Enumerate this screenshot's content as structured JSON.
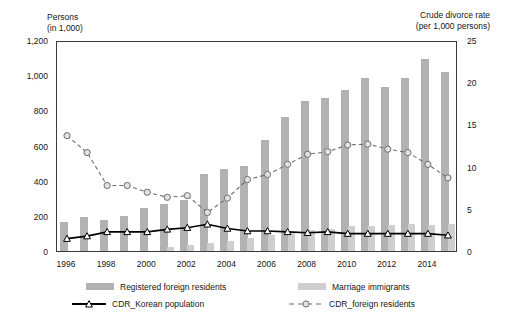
{
  "axes": {
    "left_caption": "Persons\n(in 1,000)",
    "right_caption": "Crude divorce rate\n(per 1,000 persons)",
    "left_ticks": [
      "1,200",
      "1,000",
      "800",
      "600",
      "400",
      "200",
      "0"
    ],
    "right_ticks": [
      "25",
      "20",
      "15",
      "10",
      "5",
      "0"
    ],
    "x_ticks": [
      "1996",
      "1998",
      "2000",
      "2002",
      "2004",
      "2006",
      "2008",
      "2010",
      "2012",
      "2014"
    ]
  },
  "legend": {
    "items": [
      {
        "label": "Registered foreign residents",
        "kind": "bar",
        "color": "#b2b2b2"
      },
      {
        "label": "Marriage immigrants",
        "kind": "bar",
        "color": "#cfcfcf"
      },
      {
        "label": "CDR_Korean population",
        "kind": "line-solid",
        "color": "#000000"
      },
      {
        "label": "CDR_foreign residents",
        "kind": "line-dashed",
        "color": "#6e6e6e"
      }
    ]
  },
  "chart_data": {
    "type": "bar",
    "title": "",
    "xlabel": "",
    "ylabel": "Persons (in 1,000)",
    "y2label": "Crude divorce rate (per 1,000 persons)",
    "ylim": [
      0,
      1200
    ],
    "y2lim": [
      0,
      25
    ],
    "grid": false,
    "legend_position": "bottom",
    "categories": [
      "1996",
      "1997",
      "1998",
      "1999",
      "2000",
      "2001",
      "2002",
      "2003",
      "2004",
      "2005",
      "2006",
      "2007",
      "2008",
      "2009",
      "2010",
      "2011",
      "2012",
      "2013",
      "2014",
      "2015"
    ],
    "series": [
      {
        "name": "Registered foreign residents",
        "axis": "left",
        "type": "bar",
        "color": "#b2b2b2",
        "values": [
          163,
          193,
          177,
          197,
          244,
          267,
          288,
          438,
          469,
          486,
          632,
          765,
          855,
          871,
          918,
          983,
          933,
          985,
          1092,
          1016
        ]
      },
      {
        "name": "Marriage immigrants",
        "axis": "left",
        "type": "bar",
        "color": "#cfcfcf",
        "values": [
          0,
          0,
          0,
          0,
          0,
          23,
          33,
          44,
          57,
          75,
          93,
          110,
          122,
          126,
          142,
          144,
          148,
          151,
          150,
          152
        ]
      },
      {
        "name": "CDR_Korean population",
        "axis": "right",
        "type": "line",
        "color": "#000000",
        "marker": "triangle",
        "values": [
          1.7,
          2.0,
          2.5,
          2.5,
          2.5,
          2.8,
          3.0,
          3.4,
          2.9,
          2.6,
          2.6,
          2.5,
          2.4,
          2.5,
          2.3,
          2.3,
          2.3,
          2.3,
          2.3,
          2.1
        ]
      },
      {
        "name": "CDR_foreign residents",
        "axis": "right",
        "type": "line",
        "color": "#6e6e6e",
        "marker": "circle",
        "dashed": true,
        "values": [
          13.9,
          11.9,
          8.0,
          8.0,
          7.2,
          6.6,
          6.8,
          4.8,
          6.5,
          8.7,
          9.3,
          10.5,
          11.7,
          12.0,
          12.8,
          12.9,
          12.3,
          11.9,
          10.5,
          8.9
        ]
      }
    ]
  }
}
